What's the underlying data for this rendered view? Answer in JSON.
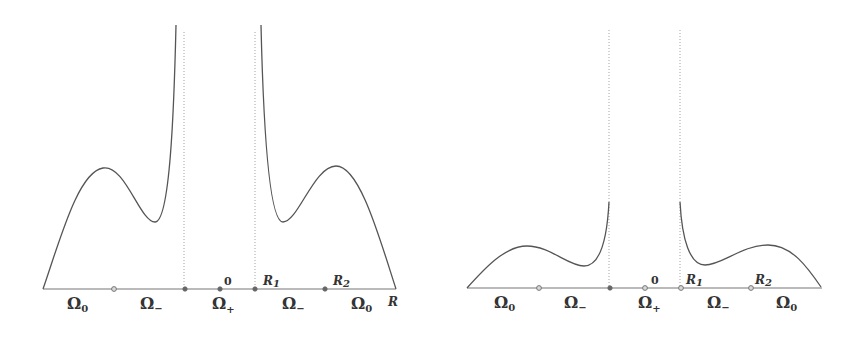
{
  "figure": {
    "panels": [
      {
        "id": "left",
        "axis": {
          "x1": 43,
          "x2": 396,
          "y": 289
        },
        "asymptotes": [
          {
            "x": 184,
            "y_top": 32
          },
          {
            "x": 255,
            "y_top": 32
          }
        ],
        "points": [
          {
            "x": 114,
            "style": "open",
            "label": ""
          },
          {
            "x": 185,
            "style": "filled",
            "label": ""
          },
          {
            "x": 220,
            "style": "filled",
            "label": "0"
          },
          {
            "x": 255,
            "style": "filled",
            "label": "R",
            "sub": "1"
          },
          {
            "x": 325,
            "style": "filled",
            "label": "R",
            "sub": "2"
          }
        ],
        "regions": [
          {
            "symbol": "Ω",
            "sub": "0",
            "x": 78
          },
          {
            "symbol": "Ω",
            "sub": "−",
            "x": 150
          },
          {
            "symbol": "Ω",
            "sub": "+",
            "x": 220
          },
          {
            "symbol": "Ω",
            "sub": "−",
            "x": 292
          },
          {
            "symbol": "Ω",
            "sub": "0",
            "x": 360
          }
        ],
        "axis_label": "R"
      },
      {
        "id": "right",
        "axis": {
          "x1": 467,
          "x2": 822,
          "y": 288
        },
        "asymptotes": [
          {
            "x": 609,
            "y_top": 30
          },
          {
            "x": 680,
            "y_top": 30
          }
        ],
        "points": [
          {
            "x": 539,
            "style": "open",
            "label": ""
          },
          {
            "x": 610,
            "style": "filled",
            "label": ""
          },
          {
            "x": 645,
            "style": "open",
            "label": "0"
          },
          {
            "x": 681,
            "style": "open",
            "label": "R",
            "sub": "1"
          },
          {
            "x": 751,
            "style": "open",
            "label": "R",
            "sub": "2"
          }
        ],
        "regions": [
          {
            "symbol": "Ω",
            "sub": "0",
            "x": 505
          },
          {
            "symbol": "Ω",
            "sub": "−",
            "x": 575
          },
          {
            "symbol": "Ω",
            "sub": "+",
            "x": 645
          },
          {
            "symbol": "Ω",
            "sub": "−",
            "x": 717
          },
          {
            "symbol": "Ω",
            "sub": "0",
            "x": 788
          }
        ],
        "axis_label": ""
      }
    ],
    "colors": {
      "curve": "#555555",
      "axis": "#777777",
      "text": "#333333"
    }
  },
  "labels": {
    "left": {
      "omega0_a": "Ω",
      "omega0_a_sub": "0",
      "omegaminus_a": "Ω",
      "omegaminus_a_sub": "−",
      "omegaplus": "Ω",
      "omegaplus_sub": "+",
      "omegaminus_b": "Ω",
      "omegaminus_b_sub": "−",
      "omega0_b": "Ω",
      "omega0_b_sub": "0",
      "zero": "0",
      "r1": "R",
      "r1_sub": "1",
      "r2": "R",
      "r2_sub": "2",
      "axis": "R"
    },
    "right": {
      "omega0_a": "Ω",
      "omega0_a_sub": "0",
      "omegaminus_a": "Ω",
      "omegaminus_a_sub": "−",
      "omegaplus": "Ω",
      "omegaplus_sub": "+",
      "omegaminus_b": "Ω",
      "omegaminus_b_sub": "−",
      "omega0_b": "Ω",
      "omega0_b_sub": "0",
      "zero": "0",
      "r1": "R",
      "r1_sub": "1",
      "r2": "R",
      "r2_sub": "2"
    }
  }
}
